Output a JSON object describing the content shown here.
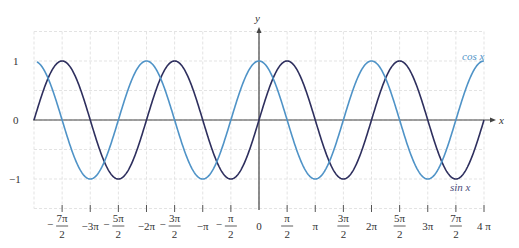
{
  "chart_data": {
    "type": "line",
    "title": "",
    "xlabel": "x",
    "ylabel": "y",
    "xlim": [
      -12.566,
      12.566
    ],
    "ylim": [
      -1.5,
      1.5
    ],
    "grid": true,
    "grid_x_step": "pi/2",
    "grid_y_step": 0.5,
    "y_ticks": [
      {
        "value": 1,
        "label": "1"
      },
      {
        "value": 0,
        "label": "0"
      },
      {
        "value": -1,
        "label": "-1"
      }
    ],
    "x_ticks": [
      {
        "value": -10.9956,
        "num": "7π",
        "den": "2",
        "sign": "−"
      },
      {
        "value": -9.4248,
        "label": "−3π"
      },
      {
        "value": -7.854,
        "num": "5π",
        "den": "2",
        "sign": "−"
      },
      {
        "value": -6.2832,
        "label": "−2π"
      },
      {
        "value": -4.7124,
        "num": "3π",
        "den": "2",
        "sign": "−"
      },
      {
        "value": -3.1416,
        "label": "−π"
      },
      {
        "value": -1.5708,
        "num": "π",
        "den": "2",
        "sign": "−"
      },
      {
        "value": 0,
        "label": "0"
      },
      {
        "value": 1.5708,
        "num": "π",
        "den": "2",
        "sign": ""
      },
      {
        "value": 3.1416,
        "label": "π"
      },
      {
        "value": 4.7124,
        "num": "3π",
        "den": "2",
        "sign": ""
      },
      {
        "value": 6.2832,
        "label": "2π"
      },
      {
        "value": 7.854,
        "num": "5π",
        "den": "2",
        "sign": ""
      },
      {
        "value": 9.4248,
        "label": "3π"
      },
      {
        "value": 10.9956,
        "num": "7π",
        "den": "2",
        "sign": ""
      },
      {
        "value": 12.5664,
        "label": "4 π"
      }
    ],
    "series": [
      {
        "name": "sin x",
        "function": "sin",
        "color": "#2e2f5e",
        "domain": [
          -12.566,
          12.566
        ],
        "label_pos": "below last minimum"
      },
      {
        "name": "cos x",
        "function": "cos",
        "color": "#4f93c7",
        "domain": [
          -12.4,
          12.566
        ],
        "label_pos": "near right end, above"
      }
    ],
    "legend": "inline curve labels"
  },
  "labels": {
    "x_axis": "x",
    "y_axis": "y",
    "cos_label": "cos x",
    "sin_label": "sin x"
  },
  "colors": {
    "sin": "#2e2f5e",
    "cos": "#4f93c7",
    "grid": "#e3e3e3",
    "axis": "#444444"
  }
}
